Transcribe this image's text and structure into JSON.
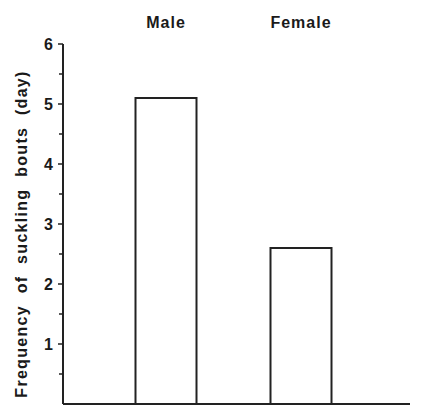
{
  "chart_data": {
    "type": "bar",
    "title": "",
    "categories": [
      "Male",
      "Female"
    ],
    "values": [
      5.1,
      2.6
    ],
    "xlabel": "",
    "ylabel": "Frequency of suckling bouts (day)",
    "ylim": [
      0,
      6
    ],
    "yticks": [
      1,
      2,
      3,
      4,
      5,
      6
    ],
    "minor_ticks": [
      0.5,
      1.5,
      2.5,
      3.5,
      4.5,
      5.5
    ],
    "grid": false,
    "legend": null,
    "category_labels_position": "top",
    "bar_fill": "#ffffff",
    "bar_stroke": "#222222"
  }
}
